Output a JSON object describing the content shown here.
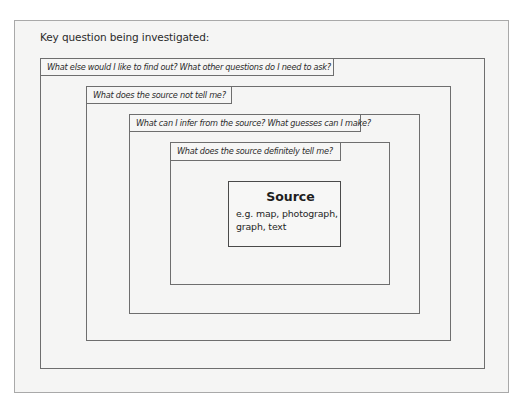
{
  "heading": "Key question being investigated:",
  "layers": [
    {
      "label": "What else would I like to find out? What other questions do I need to ask?"
    },
    {
      "label": "What does the source not tell me?"
    },
    {
      "label": "What can I infer from the source? What guesses can I make?"
    },
    {
      "label": "What does the source definitely tell me?"
    }
  ],
  "source": {
    "title": "Source",
    "description": "e.g. map, photograph, graph, text"
  },
  "colors": {
    "paper": "#f5f5f4",
    "border": "#6e6e6e",
    "text": "#2b2b2b"
  }
}
